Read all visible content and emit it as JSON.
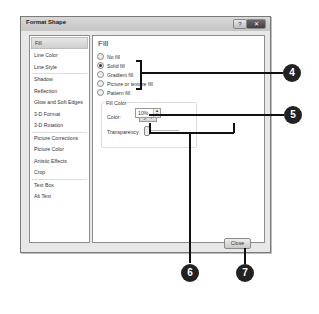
{
  "dialog": {
    "title": "Format Shape",
    "help_label": "?",
    "close_x_label": "✕"
  },
  "sidebar": {
    "items": [
      {
        "label": "Fill",
        "selected": true
      },
      {
        "label": "Line Color"
      },
      {
        "label": "Line Style"
      },
      {
        "label": "Shadow"
      },
      {
        "label": "Reflection"
      },
      {
        "label": "Glow and Soft Edges"
      },
      {
        "label": "3-D Format"
      },
      {
        "label": "3-D Rotation"
      },
      {
        "label": "Picture Corrections"
      },
      {
        "label": "Picture Color"
      },
      {
        "label": "Artistic Effects"
      },
      {
        "label": "Crop"
      },
      {
        "label": "Text Box"
      },
      {
        "label": "Alt Text"
      }
    ]
  },
  "fill": {
    "title": "Fill",
    "options": [
      {
        "label": "No fill",
        "checked": false
      },
      {
        "label": "Solid fill",
        "checked": true
      },
      {
        "label": "Gradient fill",
        "checked": false
      },
      {
        "label": "Picture or texture fill",
        "checked": false
      },
      {
        "label": "Pattern fill",
        "checked": false
      }
    ],
    "group_label": "Fill Color",
    "color_label": "Color:",
    "color_button": "🖌 ▾",
    "transparency_label": "Transparency:",
    "transparency_value": "10%",
    "transparency_percent": 10,
    "spin_up": "▲",
    "spin_down": "▼"
  },
  "footer": {
    "close_label": "Close"
  },
  "callouts": [
    "4",
    "5",
    "6",
    "7"
  ]
}
